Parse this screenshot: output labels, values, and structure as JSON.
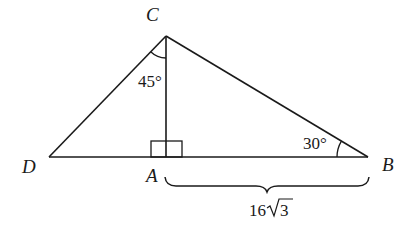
{
  "diagram": {
    "type": "geometry-triangle",
    "points": {
      "C": {
        "label": "C",
        "x": 166,
        "y": 36
      },
      "D": {
        "label": "D",
        "x": 49,
        "y": 157
      },
      "A": {
        "label": "A",
        "x": 166,
        "y": 157
      },
      "B": {
        "label": "B",
        "x": 368,
        "y": 157
      }
    },
    "angles": {
      "DCA": {
        "label": "45°"
      },
      "ABC": {
        "label": "30°"
      }
    },
    "right_angle_at": "A",
    "segment_AB_length": {
      "label_main": "16",
      "label_radical": "3"
    },
    "stroke_color": "#1a1a1a"
  }
}
